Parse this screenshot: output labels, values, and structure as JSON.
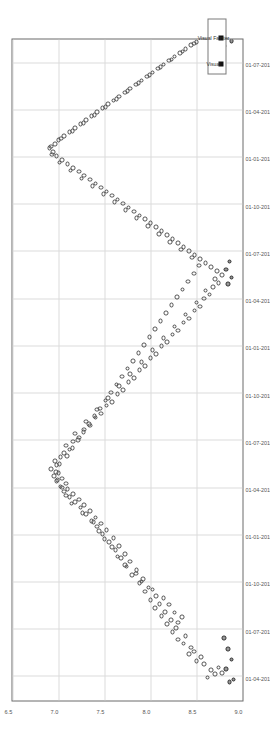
{
  "chart_data": {
    "type": "scatter",
    "title": "",
    "subtitle": "",
    "xlabel": "",
    "ylabel": "",
    "orientation": "rotated-90",
    "grid": true,
    "legend_position": "bottom-right",
    "xlim": [
      "01-01-2015",
      "01-10-2018"
    ],
    "ylim": [
      9.0,
      6.5
    ],
    "y_inverted": true,
    "xtick_labels": [
      "01-07-2018",
      "01-04-2018",
      "01-01-2018",
      "01-10-2017",
      "01-07-2017",
      "01-04-2017",
      "01-01-2017",
      "01-10-2016",
      "01-07-2016",
      "01-04-2016",
      "01-01-2016",
      "01-10-2015",
      "01-07-2015",
      "01-04-2015"
    ],
    "ytick_labels": [
      "6.5",
      "7.0",
      "7.5",
      "8.0",
      "8.5",
      "9.0"
    ],
    "ytick_values": [
      6.5,
      7.0,
      7.5,
      8.0,
      8.5,
      9.0
    ],
    "legend": [
      {
        "name": "Visual",
        "marker": "square",
        "color": "#111111"
      },
      {
        "name": "Visual Fainter",
        "marker": "square",
        "color": "#111111"
      }
    ],
    "series": [
      {
        "name": "Visual",
        "marker": "open-circle",
        "color": "#4a4a4a",
        "points": [
          [
            0.035,
            8.62
          ],
          [
            0.04,
            8.7
          ],
          [
            0.042,
            8.78
          ],
          [
            0.046,
            8.66
          ],
          [
            0.05,
            8.74
          ],
          [
            0.055,
            8.58
          ],
          [
            0.06,
            8.5
          ],
          [
            0.066,
            8.55
          ],
          [
            0.07,
            8.42
          ],
          [
            0.074,
            8.47
          ],
          [
            0.08,
            8.44
          ],
          [
            0.086,
            8.36
          ],
          [
            0.092,
            8.3
          ],
          [
            0.098,
            8.38
          ],
          [
            0.104,
            8.24
          ],
          [
            0.11,
            8.28
          ],
          [
            0.116,
            8.18
          ],
          [
            0.122,
            8.22
          ],
          [
            0.128,
            8.12
          ],
          [
            0.134,
            8.16
          ],
          [
            0.14,
            8.05
          ],
          [
            0.146,
            8.1
          ],
          [
            0.152,
            8.0
          ],
          [
            0.158,
            8.06
          ],
          [
            0.165,
            7.94
          ],
          [
            0.171,
            7.98
          ],
          [
            0.178,
            7.88
          ],
          [
            0.184,
            7.92
          ],
          [
            0.19,
            7.8
          ],
          [
            0.197,
            7.85
          ],
          [
            0.203,
            7.74
          ],
          [
            0.21,
            7.78
          ],
          [
            0.216,
            7.68
          ],
          [
            0.222,
            7.72
          ],
          [
            0.228,
            7.62
          ],
          [
            0.234,
            7.66
          ],
          [
            0.24,
            7.55
          ],
          [
            0.246,
            7.6
          ],
          [
            0.252,
            7.48
          ],
          [
            0.258,
            7.52
          ],
          [
            0.263,
            7.42
          ],
          [
            0.268,
            7.46
          ],
          [
            0.272,
            7.36
          ],
          [
            0.277,
            7.4
          ],
          [
            0.282,
            7.3
          ],
          [
            0.287,
            7.34
          ],
          [
            0.292,
            7.24
          ],
          [
            0.296,
            7.28
          ],
          [
            0.3,
            7.18
          ],
          [
            0.304,
            7.22
          ],
          [
            0.308,
            7.12
          ],
          [
            0.312,
            7.16
          ],
          [
            0.316,
            7.06
          ],
          [
            0.32,
            7.1
          ],
          [
            0.324,
            7.02
          ],
          [
            0.328,
            7.08
          ],
          [
            0.332,
            6.98
          ],
          [
            0.336,
            7.04
          ],
          [
            0.34,
            6.95
          ],
          [
            0.344,
            7.0
          ],
          [
            0.35,
            6.92
          ],
          [
            0.356,
            6.98
          ],
          [
            0.362,
            6.96
          ],
          [
            0.368,
            7.02
          ],
          [
            0.374,
            7.06
          ],
          [
            0.38,
            7.12
          ],
          [
            0.386,
            7.08
          ],
          [
            0.392,
            7.16
          ],
          [
            0.398,
            7.22
          ],
          [
            0.404,
            7.18
          ],
          [
            0.41,
            7.28
          ],
          [
            0.416,
            7.34
          ],
          [
            0.422,
            7.3
          ],
          [
            0.428,
            7.4
          ],
          [
            0.434,
            7.46
          ],
          [
            0.44,
            7.42
          ],
          [
            0.446,
            7.52
          ],
          [
            0.452,
            7.58
          ],
          [
            0.458,
            7.54
          ],
          [
            0.464,
            7.64
          ],
          [
            0.47,
            7.7
          ],
          [
            0.476,
            7.66
          ],
          [
            0.482,
            7.76
          ],
          [
            0.488,
            7.82
          ],
          [
            0.494,
            7.78
          ],
          [
            0.5,
            7.88
          ],
          [
            0.506,
            7.94
          ],
          [
            0.512,
            7.9
          ],
          [
            0.518,
            8.0
          ],
          [
            0.524,
            8.06
          ],
          [
            0.53,
            8.02
          ],
          [
            0.536,
            8.12
          ],
          [
            0.542,
            8.18
          ],
          [
            0.548,
            8.14
          ],
          [
            0.554,
            8.24
          ],
          [
            0.56,
            8.3
          ],
          [
            0.566,
            8.26
          ],
          [
            0.572,
            8.36
          ],
          [
            0.578,
            8.42
          ],
          [
            0.584,
            8.38
          ],
          [
            0.59,
            8.48
          ],
          [
            0.596,
            8.54
          ],
          [
            0.602,
            8.5
          ],
          [
            0.608,
            8.58
          ],
          [
            0.614,
            8.64
          ],
          [
            0.62,
            8.6
          ],
          [
            0.626,
            8.68
          ],
          [
            0.632,
            8.74
          ],
          [
            0.638,
            8.7
          ],
          [
            0.644,
            8.78
          ],
          [
            0.65,
            8.72
          ],
          [
            0.656,
            8.66
          ],
          [
            0.662,
            8.6
          ],
          [
            0.668,
            8.54
          ],
          [
            0.674,
            8.48
          ],
          [
            0.68,
            8.42
          ],
          [
            0.686,
            8.36
          ],
          [
            0.692,
            8.3
          ],
          [
            0.698,
            8.24
          ],
          [
            0.704,
            8.18
          ],
          [
            0.71,
            8.12
          ],
          [
            0.716,
            8.06
          ],
          [
            0.722,
            8.0
          ],
          [
            0.728,
            7.94
          ],
          [
            0.734,
            7.88
          ],
          [
            0.74,
            7.82
          ],
          [
            0.746,
            7.76
          ],
          [
            0.752,
            7.7
          ],
          [
            0.758,
            7.64
          ],
          [
            0.764,
            7.58
          ],
          [
            0.77,
            7.52
          ],
          [
            0.776,
            7.46
          ],
          [
            0.782,
            7.4
          ],
          [
            0.788,
            7.34
          ],
          [
            0.794,
            7.28
          ],
          [
            0.8,
            7.22
          ],
          [
            0.806,
            7.16
          ],
          [
            0.812,
            7.1
          ],
          [
            0.818,
            7.04
          ],
          [
            0.824,
            6.98
          ],
          [
            0.83,
            6.94
          ],
          [
            0.836,
            6.9
          ],
          [
            0.842,
            6.96
          ],
          [
            0.848,
            7.0
          ],
          [
            0.854,
            7.06
          ],
          [
            0.86,
            7.12
          ],
          [
            0.866,
            7.18
          ],
          [
            0.872,
            7.24
          ],
          [
            0.878,
            7.3
          ],
          [
            0.884,
            7.36
          ],
          [
            0.89,
            7.42
          ],
          [
            0.896,
            7.48
          ],
          [
            0.902,
            7.54
          ],
          [
            0.908,
            7.6
          ],
          [
            0.914,
            7.66
          ],
          [
            0.92,
            7.72
          ],
          [
            0.926,
            7.78
          ],
          [
            0.932,
            7.84
          ],
          [
            0.938,
            7.9
          ],
          [
            0.944,
            7.96
          ],
          [
            0.95,
            8.02
          ],
          [
            0.956,
            8.08
          ],
          [
            0.962,
            8.14
          ],
          [
            0.968,
            8.2
          ],
          [
            0.974,
            8.26
          ],
          [
            0.98,
            8.32
          ],
          [
            0.986,
            8.38
          ],
          [
            0.992,
            8.44
          ],
          [
            0.996,
            8.5
          ],
          [
            0.118,
            8.3
          ],
          [
            0.126,
            8.34
          ],
          [
            0.133,
            8.26
          ],
          [
            0.145,
            8.2
          ],
          [
            0.155,
            8.14
          ],
          [
            0.168,
            8.02
          ],
          [
            0.18,
            7.9
          ],
          [
            0.192,
            7.84
          ],
          [
            0.205,
            7.72
          ],
          [
            0.218,
            7.64
          ],
          [
            0.232,
            7.58
          ],
          [
            0.244,
            7.5
          ],
          [
            0.256,
            7.44
          ],
          [
            0.27,
            7.38
          ],
          [
            0.284,
            7.26
          ],
          [
            0.298,
            7.14
          ],
          [
            0.31,
            7.08
          ],
          [
            0.322,
            7.04
          ],
          [
            0.334,
            6.99
          ],
          [
            0.346,
            6.97
          ],
          [
            0.358,
            7.01
          ],
          [
            0.37,
            7.09
          ],
          [
            0.382,
            7.15
          ],
          [
            0.394,
            7.21
          ],
          [
            0.406,
            7.27
          ],
          [
            0.418,
            7.33
          ],
          [
            0.43,
            7.39
          ],
          [
            0.442,
            7.45
          ],
          [
            0.454,
            7.51
          ],
          [
            0.466,
            7.57
          ],
          [
            0.478,
            7.63
          ],
          [
            0.49,
            7.69
          ],
          [
            0.502,
            7.75
          ],
          [
            0.514,
            7.81
          ],
          [
            0.526,
            7.87
          ],
          [
            0.538,
            7.93
          ],
          [
            0.55,
            7.99
          ],
          [
            0.562,
            8.05
          ],
          [
            0.574,
            8.11
          ],
          [
            0.586,
            8.17
          ],
          [
            0.598,
            8.23
          ],
          [
            0.61,
            8.29
          ],
          [
            0.622,
            8.35
          ],
          [
            0.634,
            8.41
          ],
          [
            0.646,
            8.47
          ],
          [
            0.658,
            8.53
          ],
          [
            0.67,
            8.45
          ],
          [
            0.682,
            8.33
          ],
          [
            0.694,
            8.21
          ],
          [
            0.706,
            8.09
          ],
          [
            0.718,
            7.97
          ],
          [
            0.73,
            7.85
          ],
          [
            0.742,
            7.73
          ],
          [
            0.754,
            7.61
          ],
          [
            0.766,
            7.49
          ],
          [
            0.778,
            7.37
          ],
          [
            0.79,
            7.25
          ],
          [
            0.802,
            7.13
          ],
          [
            0.814,
            7.01
          ],
          [
            0.826,
            6.93
          ],
          [
            0.838,
            6.92
          ],
          [
            0.85,
            7.03
          ],
          [
            0.862,
            7.15
          ],
          [
            0.874,
            7.27
          ],
          [
            0.886,
            7.39
          ],
          [
            0.898,
            7.51
          ],
          [
            0.91,
            7.63
          ],
          [
            0.922,
            7.75
          ],
          [
            0.934,
            7.87
          ],
          [
            0.946,
            7.99
          ],
          [
            0.958,
            8.11
          ],
          [
            0.97,
            8.23
          ],
          [
            0.982,
            8.35
          ],
          [
            0.994,
            8.47
          ]
        ]
      },
      {
        "name": "Visual Fainter",
        "marker": "open-circle-filled",
        "color": "#2b2b2b",
        "points": [
          [
            0.028,
            8.86
          ],
          [
            0.032,
            8.9
          ],
          [
            0.048,
            8.82
          ],
          [
            0.062,
            8.88
          ],
          [
            0.078,
            8.84
          ],
          [
            0.095,
            8.8
          ],
          [
            0.63,
            8.84
          ],
          [
            0.64,
            8.88
          ],
          [
            0.652,
            8.82
          ],
          [
            0.664,
            8.86
          ],
          [
            0.99,
            8.8
          ],
          [
            0.998,
            8.88
          ]
        ]
      }
    ]
  },
  "legend": {
    "items": [
      {
        "label": "Visual"
      },
      {
        "label": "Visual Fainter"
      }
    ]
  }
}
